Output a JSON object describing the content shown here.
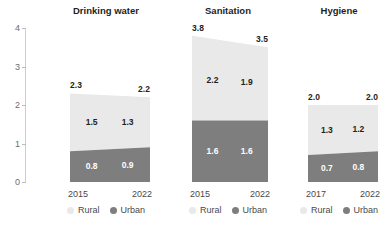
{
  "chart_data": {
    "type": "area",
    "title": "",
    "xlabel": "",
    "ylabel": "",
    "ylim": [
      0,
      4
    ],
    "yticks": [
      "0",
      "1",
      "2",
      "3",
      "4"
    ],
    "grid": false,
    "legend_position": "bottom",
    "legend": [
      {
        "name": "Rural",
        "color": "#e9e9e9"
      },
      {
        "name": "Urban",
        "color": "#7e7e7e"
      }
    ],
    "panels": [
      {
        "title": "Drinking water",
        "x": [
          "2015",
          "2022"
        ],
        "series": [
          {
            "name": "Rural",
            "values": [
              1.5,
              1.3
            ],
            "labels": [
              "1.5",
              "1.3"
            ]
          },
          {
            "name": "Urban",
            "values": [
              0.8,
              0.9
            ],
            "labels": [
              "0.8",
              "0.9"
            ]
          }
        ],
        "totals": [
          2.3,
          2.2
        ],
        "total_labels": [
          "2.3",
          "2.2"
        ]
      },
      {
        "title": "Sanitation",
        "x": [
          "2015",
          "2022"
        ],
        "series": [
          {
            "name": "Rural",
            "values": [
              2.2,
              1.9
            ],
            "labels": [
              "2.2",
              "1.9"
            ]
          },
          {
            "name": "Urban",
            "values": [
              1.6,
              1.6
            ],
            "labels": [
              "1.6",
              "1.6"
            ]
          }
        ],
        "totals": [
          3.8,
          3.5
        ],
        "total_labels": [
          "3.8",
          "3.5"
        ]
      },
      {
        "title": "Hygiene",
        "x": [
          "2017",
          "2022"
        ],
        "series": [
          {
            "name": "Rural",
            "values": [
              1.3,
              1.2
            ],
            "labels": [
              "1.3",
              "1.2"
            ]
          },
          {
            "name": "Urban",
            "values": [
              0.7,
              0.8
            ],
            "labels": [
              "0.7",
              "0.8"
            ]
          }
        ],
        "totals": [
          2.0,
          2.0
        ],
        "total_labels": [
          "2.0",
          "2.0"
        ]
      }
    ]
  }
}
